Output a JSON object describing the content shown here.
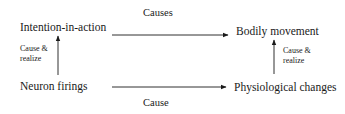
{
  "diagram": {
    "nodes": {
      "intention": "Intention-in-action",
      "bodily": "Bodily movement",
      "neuron": "Neuron firings",
      "physio": "Physiological changes"
    },
    "edges": {
      "top": "Causes",
      "bottom": "Cause",
      "left_line1": "Cause &",
      "left_line2": "realize",
      "right_line1": "Cause &",
      "right_line2": "realize"
    },
    "relations": [
      {
        "from": "Intention-in-action",
        "to": "Bodily movement",
        "label": "Causes"
      },
      {
        "from": "Neuron firings",
        "to": "Physiological changes",
        "label": "Cause"
      },
      {
        "from": "Neuron firings",
        "to": "Intention-in-action",
        "label": "Cause & realize"
      },
      {
        "from": "Physiological changes",
        "to": "Bodily movement",
        "label": "Cause & realize"
      }
    ],
    "colors": {
      "ink": "#1a1a1a",
      "background": "#ffffff"
    }
  }
}
